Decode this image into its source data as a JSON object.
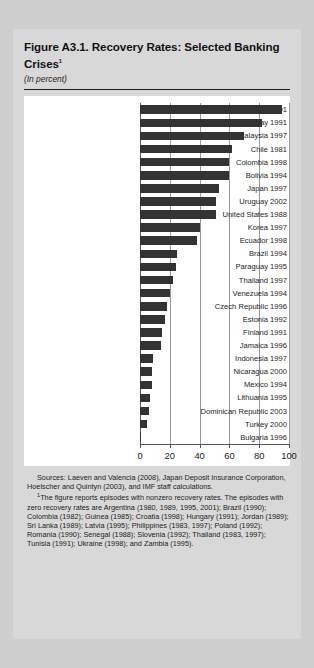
{
  "figure": {
    "title": "Figure A3.1.  Recovery Rates: Selected Banking Crises",
    "title_footnote_marker": "1",
    "subtitle": "(In percent)",
    "sources": "Sources:  Laeven and Valencia (2008), Japan Deposit Insurance Corporation, Hoelscher and Quintyn (2003), and IMF staff calculations.",
    "footnote_marker": "1",
    "footnote": "The figure reports episodes with nonzero recovery rates. The episodes with zero recovery rates are Argentina (1980, 1989, 1995, 2001); Brazil (1990); Colombia (1982); Guinea (1985); Croatia (1998); Hungary (1991); Jordan (1989); Sri Lanka (1989); Latvia (1995); Philippines (1983, 1997); Poland (1992); Romania (1990); Senegal (1988); Slovenia (1992); Thailand (1983, 1997); Tunisia (1991); Ukraine (1998); and Zambia (1995)."
  },
  "chart_data": {
    "type": "bar",
    "orientation": "horizontal",
    "title": "Figure A3.1.  Recovery Rates: Selected Banking Crises",
    "subtitle": "(In percent)",
    "xlabel": "",
    "ylabel": "",
    "xlim": [
      0,
      100
    ],
    "xticks": [
      0,
      20,
      40,
      60,
      80,
      100
    ],
    "xtick_labels": [
      "0",
      "20",
      "40",
      "60",
      "80",
      "100"
    ],
    "grid": true,
    "legend": "none",
    "bar_color": "#333333",
    "categories": [
      "Sweden 1991",
      "Norway 1991",
      "Malaysia 1997",
      "Chile 1981",
      "Colombia 1998",
      "Bolivia 1994",
      "Japan 1997",
      "Uruguay 2002",
      "United States 1988",
      "Korea 1997",
      "Ecuador 1998",
      "Brazil 1994",
      "Paraguay 1995",
      "Thailand 1997",
      "Venezuela 1994",
      "Czech Republic 1996",
      "Estonia 1992",
      "Finland 1991",
      "Jamaica 1996",
      "Indonesia 1997",
      "Nicaragua 2000",
      "Mexico 1994",
      "Lithuania 1995",
      "Dominican Republic 2003",
      "Turkey 2000",
      "Bulgaria 1996"
    ],
    "values": [
      95.0,
      82.0,
      70.0,
      62.0,
      60.0,
      60.0,
      53.0,
      51.0,
      51.0,
      40.0,
      38.0,
      25.0,
      24.0,
      22.0,
      20.0,
      18.0,
      17.0,
      15.0,
      14.0,
      9.0,
      8.0,
      8.0,
      7.0,
      6.0,
      5.0,
      1.0
    ]
  }
}
